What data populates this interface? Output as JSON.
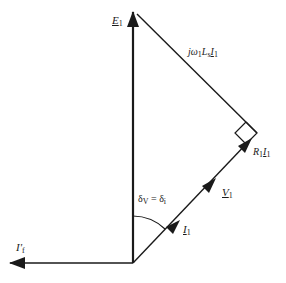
{
  "diagram": {
    "type": "phasor-diagram",
    "origin": [
      133,
      263
    ],
    "phasors": [
      {
        "id": "E1",
        "label_main": "E",
        "label_sub": "1",
        "underline": true,
        "from": [
          133,
          263
        ],
        "to": [
          133,
          10
        ]
      },
      {
        "id": "I_f",
        "label_main": "I'",
        "label_sub": "f",
        "underline": false,
        "from": [
          133,
          263
        ],
        "to": [
          10,
          263
        ]
      },
      {
        "id": "I1",
        "label_main": "I",
        "label_sub": "1",
        "underline": true,
        "from": [
          133,
          263
        ],
        "to": [
          178,
          222
        ]
      },
      {
        "id": "V1",
        "label_main": "V",
        "label_sub": "1",
        "underline": true,
        "from": [
          133,
          263
        ],
        "to": [
          213,
          182
        ]
      },
      {
        "id": "R1I1",
        "label_main": "R",
        "label_sub": "1",
        "label_main2": "I",
        "label_sub2": "1",
        "from": [
          213,
          182
        ],
        "to": [
          250,
          140
        ]
      },
      {
        "id": "jw1LsI1",
        "label_text": "jω",
        "label_sub": "1",
        "label_main2": "L",
        "label_sub2": "s",
        "label_main3": "I",
        "label_sub3": "1",
        "from": [
          257,
          133
        ],
        "to": [
          135,
          12
        ]
      }
    ],
    "angle_label": {
      "delta": "δ",
      "sub_v": "V",
      "eq": " = ",
      "sub_i": "i"
    },
    "labels": {
      "E1": {
        "main": "E",
        "sub": "1"
      },
      "If": {
        "main": "I'",
        "sub": "f"
      },
      "I1": {
        "main": "I",
        "sub": "1"
      },
      "V1": {
        "main": "V",
        "sub": "1"
      },
      "R1I1": {
        "r": "R",
        "rsub": "1",
        "i": "I",
        "isub": "1"
      },
      "jwLI": {
        "j": "jω",
        "wsub": "1",
        "l": "L",
        "lsub": "s",
        "i": "I",
        "isub": "1"
      }
    },
    "colors": {
      "line": "#1a1a1a",
      "background": "#ffffff"
    }
  }
}
